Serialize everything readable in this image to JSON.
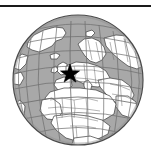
{
  "figure": {
    "kind": "locator-globe-map",
    "title": "",
    "caption": "",
    "background_color": "#ffffff",
    "rule": {
      "name": "top-horizontal-rule",
      "color": "#1a1a1a",
      "x": 0,
      "y": 5,
      "width": 151,
      "height": 2
    }
  },
  "chart_data": {
    "type": "map",
    "projection": "orthographic",
    "title": "",
    "subtitle": "",
    "xlabel": "",
    "ylabel": "",
    "legend": [],
    "annotations": [
      {
        "label": "",
        "marker": "star",
        "marker_color": "#000000",
        "lon": -2.0,
        "lat": 48.0,
        "px": 70,
        "py": 74,
        "radius_px": 10,
        "region": "Western Europe"
      }
    ],
    "projection_center": {
      "lon": 5,
      "lat": 30
    },
    "globe": {
      "center_x": 78,
      "center_y": 80,
      "radius": 65,
      "ocean_color": "#a8a8a8",
      "land_color": "#ffffff",
      "outline_color": "#3a3a3a",
      "graticule_color": "#6e6e6e",
      "graticule_spacing_deg": 15,
      "limb_color": "#4a4a4a"
    },
    "visible_regions": [
      "Europe",
      "Africa",
      "North Atlantic Ocean",
      "Arctic Ocean",
      "Greenland",
      "Middle East",
      "Western Asia",
      "South Atlantic Ocean"
    ]
  },
  "colors": {
    "ink": "#1a1a1a",
    "ocean": "#a8a8a8",
    "land": "#ffffff",
    "coastline": "#3a3a3a",
    "border": "#5a5a5a",
    "graticule": "#707070",
    "marker": "#000000",
    "page": "#ffffff"
  }
}
